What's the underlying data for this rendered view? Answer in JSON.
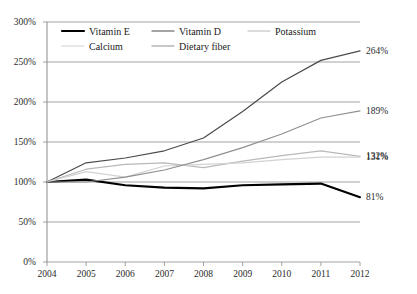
{
  "chart_data": {
    "type": "line",
    "title": "",
    "xlabel": "",
    "ylabel": "",
    "x": [
      2004,
      2005,
      2006,
      2007,
      2008,
      2009,
      2010,
      2011,
      2012
    ],
    "categories": [
      "2004",
      "2005",
      "2006",
      "2007",
      "2008",
      "2009",
      "2010",
      "2011",
      "2012"
    ],
    "xlim": [
      2004,
      2012
    ],
    "ylim": [
      0,
      300
    ],
    "yticks": [
      "0%",
      "50%",
      "100%",
      "150%",
      "200%",
      "250%",
      "300%"
    ],
    "ytick_values": [
      0,
      50,
      100,
      150,
      200,
      250,
      300
    ],
    "grid": "horizontal",
    "legend_position": "top-inside",
    "series": [
      {
        "name": "Vitamin E",
        "color": "#000000",
        "width": 2.1,
        "values": [
          100,
          103,
          96,
          93,
          92,
          96,
          97,
          98,
          81
        ],
        "end_label": "81%"
      },
      {
        "name": "Vitamin D",
        "color": "#4a4a4a",
        "width": 1.2,
        "values": [
          100,
          124,
          130,
          139,
          155,
          188,
          225,
          252,
          264
        ],
        "end_label": "264%"
      },
      {
        "name": "Potassium",
        "color": "#b9b9b9",
        "width": 1.2,
        "values": [
          100,
          116,
          122,
          124,
          118,
          126,
          133,
          139,
          132
        ],
        "end_label": "132%"
      },
      {
        "name": "Calcium",
        "color": "#d2d2d2",
        "width": 1.2,
        "values": [
          100,
          113,
          106,
          120,
          122,
          124,
          128,
          131,
          131
        ],
        "end_label": "131%"
      },
      {
        "name": "Dietary fiber",
        "color": "#909090",
        "width": 1.2,
        "values": [
          100,
          100,
          106,
          115,
          128,
          143,
          160,
          180,
          189
        ],
        "end_label": "189%"
      }
    ],
    "end_labels": [
      {
        "text": "264%",
        "series": "Vitamin D",
        "value": 264
      },
      {
        "text": "189%",
        "series": "Dietary fiber",
        "value": 189
      },
      {
        "text": "132%",
        "series": "Potassium",
        "value": 132
      },
      {
        "text": "131%",
        "series": "Calcium",
        "value": 131
      },
      {
        "text": "81%",
        "series": "Vitamin E",
        "value": 81
      }
    ],
    "legend": [
      {
        "label": "Vitamin E",
        "color": "#000000",
        "row": 0,
        "col": 0
      },
      {
        "label": "Vitamin D",
        "color": "#4a4a4a",
        "row": 0,
        "col": 1
      },
      {
        "label": "Potassium",
        "color": "#b9b9b9",
        "row": 0,
        "col": 2
      },
      {
        "label": "Calcium",
        "color": "#d2d2d2",
        "row": 1,
        "col": 0
      },
      {
        "label": "Dietary fiber",
        "color": "#909090",
        "row": 1,
        "col": 1
      }
    ]
  },
  "axis_color": "#8c8c8c",
  "grid_color": "#8c8c8c"
}
